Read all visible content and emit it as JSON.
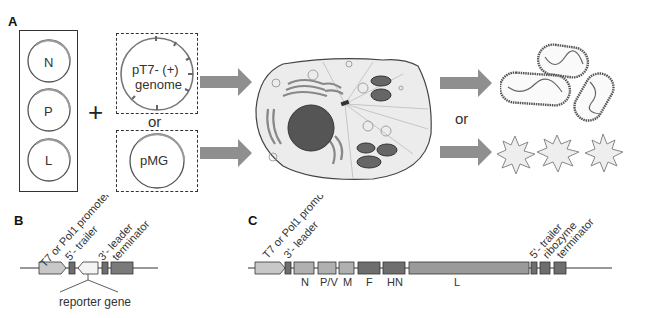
{
  "panels": {
    "a": {
      "label": "A",
      "helper_plasmids": [
        {
          "label": "N"
        },
        {
          "label": "P"
        },
        {
          "label": "L"
        }
      ],
      "plus": "+",
      "genome_plasmid": {
        "line1": "pT7- (+)",
        "line2": "genome"
      },
      "or_1": "or",
      "minigenome_plasmid": {
        "label": "pMG"
      },
      "or_2": "or",
      "outcomes": [
        "virions",
        "reporter-signal"
      ]
    },
    "b": {
      "label": "B",
      "elements": [
        {
          "label": "T7 or Pol1 promoter"
        },
        {
          "label": "5'- trailer"
        },
        {
          "label": "3'- leader"
        },
        {
          "label": "terminator"
        }
      ],
      "reporter_label": "reporter gene"
    },
    "c": {
      "label": "C",
      "upstream_labels": [
        {
          "label": "T7 or Pol1 promoter"
        },
        {
          "label": "3'- leader"
        }
      ],
      "genes": [
        {
          "label": "N"
        },
        {
          "label": "P/V"
        },
        {
          "label": "M"
        },
        {
          "label": "F"
        },
        {
          "label": "HN"
        },
        {
          "label": "L"
        }
      ],
      "downstream_labels": [
        {
          "label": "5'- trailer"
        },
        {
          "label": "ribozyme"
        },
        {
          "label": "terminator"
        }
      ]
    }
  },
  "colors": {
    "arrow": "#8f8f8f",
    "light_box": "#c8c8c8",
    "mid_box": "#9a9a9a",
    "dark_box": "#6e6e6e",
    "cell_fill": "#ececec",
    "nucleus": "#555555"
  }
}
